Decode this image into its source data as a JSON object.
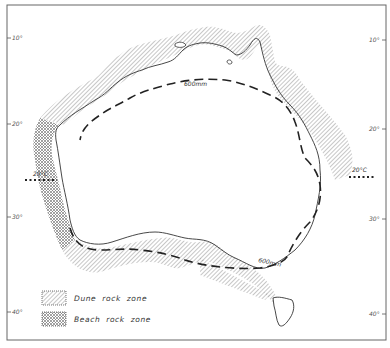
{
  "map": {
    "subject": "Australia coastal rock zones",
    "latitude_labels_left": [
      "10°",
      "20°",
      "30°",
      "40°"
    ],
    "latitude_labels_right": [
      "10°",
      "20°",
      "30°",
      "40°"
    ],
    "isohyet_label_north": "600mm",
    "isohyet_label_south": "600mm",
    "isotherm_label_west": "20°C",
    "isotherm_label_east": "20°C"
  },
  "legend": {
    "items": [
      {
        "label": "Dune rock zone",
        "pattern": "diagonal-hatch"
      },
      {
        "label": "Beach rock zone",
        "pattern": "cross-hatch"
      }
    ]
  },
  "colors": {
    "frame": "#555555",
    "coastline": "#333333",
    "hatch": "#9a9a9a",
    "isohyet": "#222222"
  }
}
